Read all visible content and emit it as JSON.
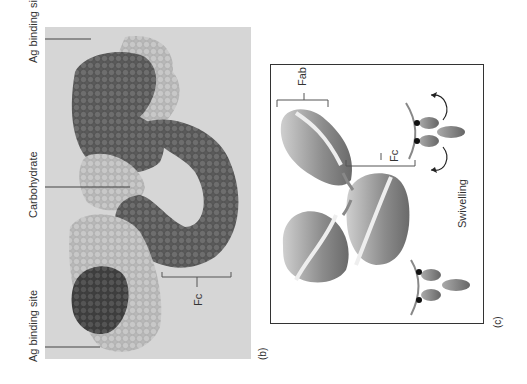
{
  "figure": {
    "panel_b": {
      "label": "(b)",
      "annotations": {
        "ag_binding_site_top": "Ag binding site",
        "carbohydrate": "Carbohydrate",
        "ag_binding_site_bottom": "Ag binding site",
        "fc": "Fc"
      }
    },
    "panel_c": {
      "label": "(c)",
      "annotations": {
        "fab": "Fab",
        "fc": "Fc",
        "swivelling": "Swivelling"
      }
    },
    "colors": {
      "background_b": "#d6d6d6",
      "dark_chain": "#5e5e5e",
      "light_chain": "#bdbdbd",
      "frame": "#333333",
      "antigen_curve": "#8a8a8a"
    }
  }
}
